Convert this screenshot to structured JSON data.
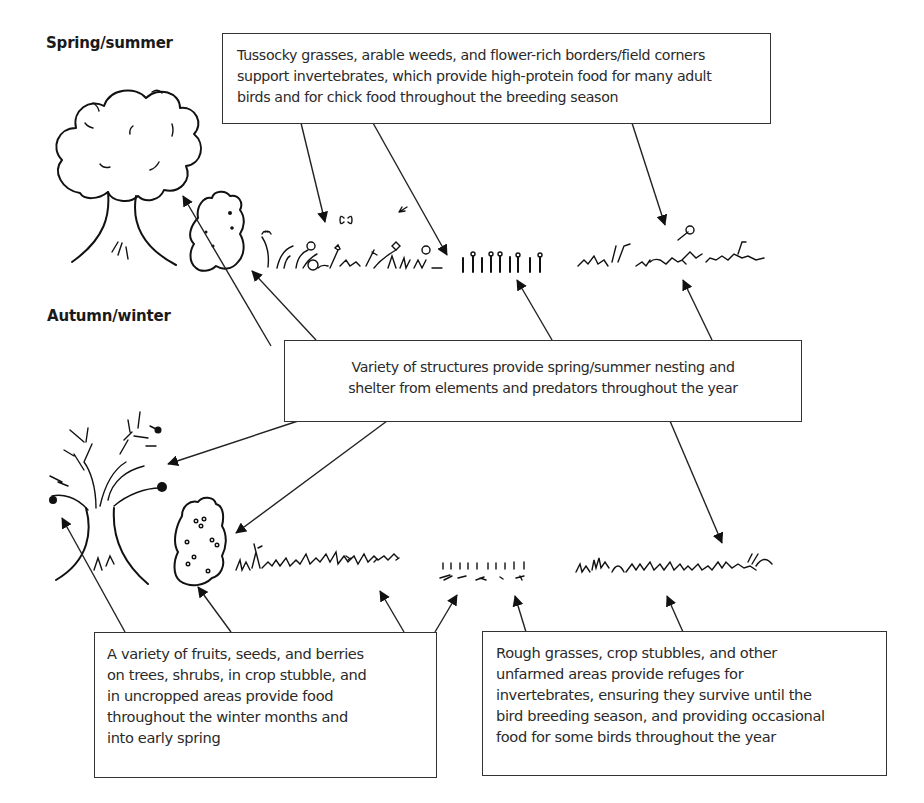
{
  "labels": {
    "spring_summer": "Spring/summer",
    "autumn_winter": "Autumn/winter"
  },
  "callouts": {
    "invertebrates_food": {
      "lines": [
        "Tussocky grasses, arable weeds, and flower-rich borders/field corners",
        "support invertebrates, which provide high-protein food for many adult",
        "birds and for chick food throughout the breeding season"
      ]
    },
    "structures_shelter": {
      "lines": [
        "Variety of structures provide spring/summer nesting and",
        "shelter from elements and predators throughout the year"
      ]
    },
    "winter_food": {
      "lines": [
        "A variety of fruits, seeds, and berries",
        "on trees, shrubs, in crop stubble, and",
        "in uncropped areas provide food",
        "throughout the winter months and",
        "into early spring"
      ]
    },
    "refuges": {
      "lines": [
        "Rough grasses, crop stubbles, and other",
        "unfarmed areas provide refuges for",
        "invertebrates, ensuring they survive until the",
        "bird breeding season, and providing occasional",
        "food for some birds throughout the year"
      ]
    }
  },
  "illustrations": {
    "spring_summer": [
      "leafy-tree-icon",
      "leafy-shrub-icon",
      "flowering-weeds-icon",
      "crop-stubble-icon",
      "tussocky-grass-icon"
    ],
    "autumn_winter": [
      "bare-fruiting-tree-icon",
      "berry-shrub-icon",
      "seeding-weeds-icon",
      "cut-stubble-icon",
      "rough-grass-icon"
    ]
  },
  "colors": {
    "ink": "#111111",
    "box_border": "#333333",
    "text": "#2a2a2a",
    "background": "#ffffff"
  }
}
